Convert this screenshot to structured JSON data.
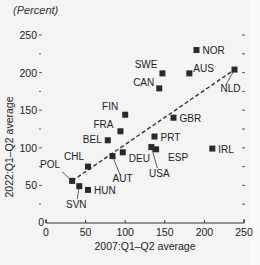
{
  "header": {
    "title_partial": "",
    "units": "(Percent)"
  },
  "chart_data": {
    "type": "scatter",
    "title": "",
    "units": "(Percent)",
    "xlabel": "2007:Q1–Q2 average",
    "ylabel": "2022:Q1–Q2 average",
    "xlim": [
      0,
      250
    ],
    "ylim": [
      0,
      250
    ],
    "xticks": [
      0,
      50,
      100,
      150,
      200,
      250
    ],
    "yticks": [
      0,
      50,
      100,
      150,
      200,
      250
    ],
    "grid": false,
    "legend": null,
    "points": [
      {
        "label": "NOR",
        "x": 190,
        "y": 230
      },
      {
        "label": "SWE",
        "x": 147,
        "y": 199
      },
      {
        "label": "AUS",
        "x": 181,
        "y": 199
      },
      {
        "label": "NLD",
        "x": 238,
        "y": 204
      },
      {
        "label": "CAN",
        "x": 143,
        "y": 179
      },
      {
        "label": "FIN",
        "x": 100,
        "y": 144
      },
      {
        "label": "GBR",
        "x": 161,
        "y": 140
      },
      {
        "label": "FRA",
        "x": 94,
        "y": 122
      },
      {
        "label": "PRT",
        "x": 137,
        "y": 115
      },
      {
        "label": "BEL",
        "x": 78,
        "y": 110
      },
      {
        "label": "IRL",
        "x": 210,
        "y": 99
      },
      {
        "label": "USA",
        "x": 133,
        "y": 101
      },
      {
        "label": "ESP",
        "x": 139,
        "y": 98
      },
      {
        "label": "DEU",
        "x": 97,
        "y": 94
      },
      {
        "label": "AUT",
        "x": 84,
        "y": 89
      },
      {
        "label": "CHL",
        "x": 53,
        "y": 75
      },
      {
        "label": "POL",
        "x": 33,
        "y": 56
      },
      {
        "label": "SVN",
        "x": 42,
        "y": 49
      },
      {
        "label": "HUN",
        "x": 53,
        "y": 44
      }
    ],
    "trendline": {
      "style": "dashed",
      "from": {
        "x": 33,
        "y": 56
      },
      "to": {
        "x": 238,
        "y": 204
      }
    },
    "colors": {
      "marker": "#2a2a2a",
      "line": "#333333",
      "background": "#f4f4f4"
    }
  }
}
